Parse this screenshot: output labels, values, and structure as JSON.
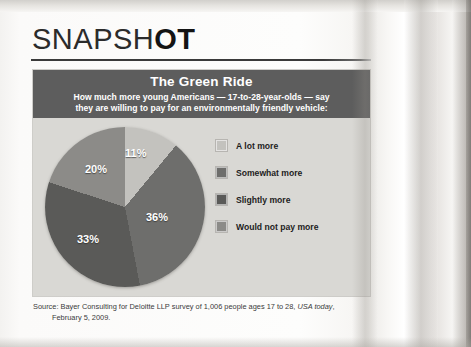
{
  "masthead": {
    "text_light": "SNAPSH",
    "text_bold": "OT"
  },
  "card": {
    "title": "The Green Ride",
    "subtitle_line1": "How much more young Americans — 17-to-28-year-olds — say",
    "subtitle_line2": "they are willing to pay for an environmentally friendly vehicle:",
    "header_bg": "#5d5d5d",
    "panel_bg": "#d9d8d4"
  },
  "chart_data": {
    "type": "pie",
    "title": "The Green Ride",
    "subtitle": "How much more young Americans — 17-to-28-year-olds — say they are willing to pay for an environmentally friendly vehicle:",
    "legend_position": "right",
    "start_angle_deg": 0,
    "direction": "clockwise",
    "categories": [
      "A lot more",
      "Somewhat more",
      "Slightly more",
      "Would not pay more"
    ],
    "values": [
      11,
      36,
      33,
      20
    ],
    "labels": [
      "11%",
      "36%",
      "33%",
      "20%"
    ],
    "unit": "%",
    "colors": [
      "#c3c2be",
      "#6e6e6c",
      "#5a5a58",
      "#8c8b88"
    ]
  },
  "source": {
    "line1_pre": "Source: Bayer Consulting for Deloitte LLP survey of 1,006 people ages 17 to 28, ",
    "line1_italic": "USA today",
    "line1_post": ",",
    "line2": "February 5, 2009."
  }
}
